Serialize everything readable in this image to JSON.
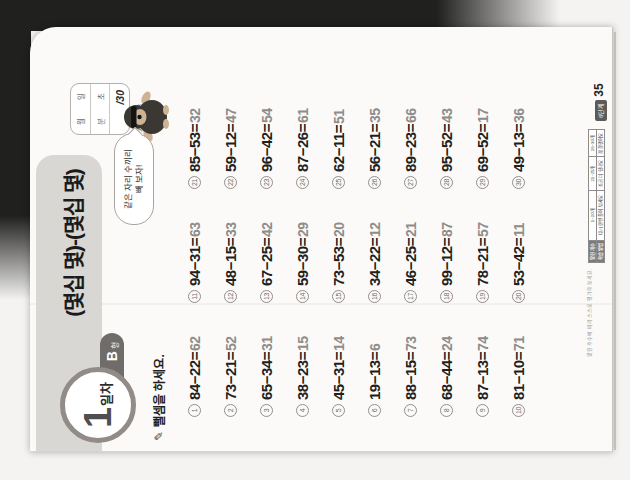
{
  "header": {
    "day_number": "1",
    "day_suffix": "일차",
    "form_letter": "B",
    "form_suffix": "형",
    "title": "(몇십 몇)-(몇십 몇)",
    "score_box": {
      "date_labels": [
        "월",
        "일"
      ],
      "time_labels": [
        "분",
        "초"
      ],
      "total": "/30"
    },
    "answer_note": "※ 정답 12쪽",
    "bubble_line1": "같은 자리 수끼리",
    "bubble_line2": "빼 보자!"
  },
  "instruction": {
    "icon": "✎",
    "text": "뺄셈을 하세요."
  },
  "problems": [
    {
      "no": "1",
      "expr": "84−22=",
      "ans": "62"
    },
    {
      "no": "2",
      "expr": "73−21=",
      "ans": "52"
    },
    {
      "no": "3",
      "expr": "65−34=",
      "ans": "31"
    },
    {
      "no": "4",
      "expr": "38−23=",
      "ans": "15"
    },
    {
      "no": "5",
      "expr": "45−31=",
      "ans": "14"
    },
    {
      "no": "6",
      "expr": "19−13=",
      "ans": "6"
    },
    {
      "no": "7",
      "expr": "88−15=",
      "ans": "73"
    },
    {
      "no": "8",
      "expr": "68−44=",
      "ans": "24"
    },
    {
      "no": "9",
      "expr": "87−13=",
      "ans": "74"
    },
    {
      "no": "10",
      "expr": "81−10=",
      "ans": "71"
    },
    {
      "no": "11",
      "expr": "94−31=",
      "ans": "63"
    },
    {
      "no": "12",
      "expr": "48−15=",
      "ans": "33"
    },
    {
      "no": "13",
      "expr": "67−25=",
      "ans": "42"
    },
    {
      "no": "14",
      "expr": "59−30=",
      "ans": "29"
    },
    {
      "no": "15",
      "expr": "73−53=",
      "ans": "20"
    },
    {
      "no": "16",
      "expr": "34−22=",
      "ans": "12"
    },
    {
      "no": "17",
      "expr": "46−25=",
      "ans": "21"
    },
    {
      "no": "18",
      "expr": "99−12=",
      "ans": "87"
    },
    {
      "no": "19",
      "expr": "78−21=",
      "ans": "57"
    },
    {
      "no": "20",
      "expr": "53−42=",
      "ans": "11"
    },
    {
      "no": "21",
      "expr": "85−53=",
      "ans": "32"
    },
    {
      "no": "22",
      "expr": "59−12=",
      "ans": "47"
    },
    {
      "no": "23",
      "expr": "96−42=",
      "ans": "54"
    },
    {
      "no": "24",
      "expr": "87−26=",
      "ans": "61"
    },
    {
      "no": "25",
      "expr": "62−11=",
      "ans": "51"
    },
    {
      "no": "26",
      "expr": "56−21=",
      "ans": "35"
    },
    {
      "no": "27",
      "expr": "89−23=",
      "ans": "66"
    },
    {
      "no": "28",
      "expr": "95−52=",
      "ans": "43"
    },
    {
      "no": "29",
      "expr": "69−52=",
      "ans": "17"
    },
    {
      "no": "30",
      "expr": "49−13=",
      "ans": "36"
    }
  ],
  "footer": {
    "caption": "맞힌 개수에 따라 스스로 평가해 보세요.",
    "table_rows": [
      [
        "맞힌 개수",
        "1~20개",
        "21~25개",
        "26~30개"
      ],
      [
        "학습 방법",
        "다시 한번 풀어 보세요",
        "조금 더 힘내요",
        "참 잘했어요"
      ]
    ],
    "book_level": "6단계",
    "page_number": "35"
  },
  "colors": {
    "backdrop": "#20201f",
    "page": "#fbfaf8",
    "header_band": "#d8d7d4",
    "badge_border": "#918c87",
    "form_tab": "#6f6c69",
    "answer_text": "#8f8d8a",
    "table_header": "#7c7a78"
  }
}
